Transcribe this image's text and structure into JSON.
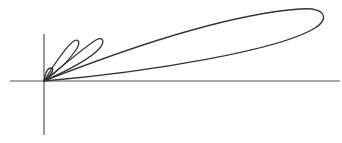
{
  "figure": {
    "type": "polar-lobe-plot",
    "colors": {
      "axis": "#555555",
      "curve": "#333333",
      "background": "#ffffff"
    },
    "axes": {
      "origin": [
        44,
        81
      ],
      "x_axis": {
        "from": 10,
        "to": 340
      },
      "y_axis": {
        "from": 34,
        "to": 135
      }
    },
    "lobes": [
      {
        "name": "tiny",
        "tip": [
          52,
          70
        ]
      },
      {
        "name": "small",
        "tip": [
          77,
          42
        ]
      },
      {
        "name": "medium",
        "tip": [
          102,
          40
        ]
      },
      {
        "name": "large",
        "tip": [
          323,
          20
        ]
      }
    ]
  }
}
